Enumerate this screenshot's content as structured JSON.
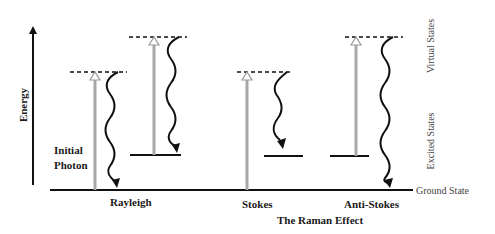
{
  "title": "The Raman Effect",
  "axis": {
    "label": "Energy"
  },
  "right_labels": {
    "virtual": "Virtual States",
    "excited": "Excited States",
    "ground": "Ground State"
  },
  "annotations": {
    "initial_photon_line1": "Initial",
    "initial_photon_line2": "Photon"
  },
  "processes": [
    {
      "label": "Rayleigh"
    },
    {
      "label": "Stokes"
    },
    {
      "label": "Anti-Stokes"
    }
  ],
  "colors": {
    "line": "#111111",
    "excitation_arrow": "#a8a8a8",
    "text": "#1a1a1a",
    "side_text": "#444444"
  }
}
